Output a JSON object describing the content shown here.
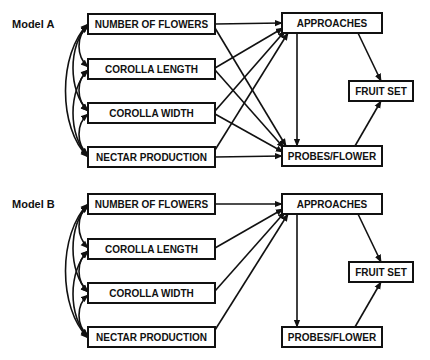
{
  "diagram": {
    "type": "path-diagram",
    "models": [
      {
        "label": "Model A",
        "exogenous": [
          "NUMBER OF FLOWERS",
          "COROLLA LENGTH",
          "COROLLA WIDTH",
          "NECTAR PRODUCTION"
        ],
        "endogenous": [
          "APPROACHES",
          "PROBES/FLOWER",
          "FRUIT SET"
        ],
        "paths": [
          [
            "NUMBER OF FLOWERS",
            "APPROACHES"
          ],
          [
            "NUMBER OF FLOWERS",
            "PROBES/FLOWER"
          ],
          [
            "COROLLA LENGTH",
            "APPROACHES"
          ],
          [
            "COROLLA LENGTH",
            "PROBES/FLOWER"
          ],
          [
            "COROLLA WIDTH",
            "APPROACHES"
          ],
          [
            "COROLLA WIDTH",
            "PROBES/FLOWER"
          ],
          [
            "NECTAR PRODUCTION",
            "APPROACHES"
          ],
          [
            "NECTAR PRODUCTION",
            "PROBES/FLOWER"
          ],
          [
            "APPROACHES",
            "PROBES/FLOWER"
          ],
          [
            "APPROACHES",
            "FRUIT SET"
          ],
          [
            "PROBES/FLOWER",
            "FRUIT SET"
          ]
        ],
        "correlations": "all pairs of exogenous variables (curved double-headed arrows)"
      },
      {
        "label": "Model B",
        "exogenous": [
          "NUMBER OF FLOWERS",
          "COROLLA LENGTH",
          "COROLLA WIDTH",
          "NECTAR PRODUCTION"
        ],
        "endogenous": [
          "APPROACHES",
          "PROBES/FLOWER",
          "FRUIT SET"
        ],
        "paths": [
          [
            "NUMBER OF FLOWERS",
            "APPROACHES"
          ],
          [
            "COROLLA LENGTH",
            "APPROACHES"
          ],
          [
            "COROLLA WIDTH",
            "APPROACHES"
          ],
          [
            "NECTAR PRODUCTION",
            "APPROACHES"
          ],
          [
            "APPROACHES",
            "PROBES/FLOWER"
          ],
          [
            "APPROACHES",
            "FRUIT SET"
          ],
          [
            "PROBES/FLOWER",
            "FRUIT SET"
          ]
        ],
        "correlations": "all pairs of exogenous variables (curved double-headed arrows)"
      }
    ]
  },
  "labels": {
    "modelA": "Model A",
    "modelB": "Model B",
    "flowers": "NUMBER OF FLOWERS",
    "length": "COROLLA LENGTH",
    "width": "COROLLA WIDTH",
    "nectar": "NECTAR PRODUCTION",
    "approaches": "APPROACHES",
    "probes": "PROBES/FLOWER",
    "fruit": "FRUIT SET"
  }
}
